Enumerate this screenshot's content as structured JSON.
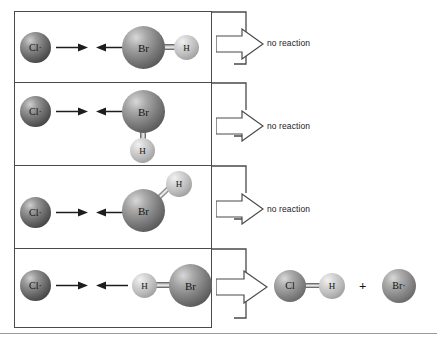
{
  "figure": {
    "type": "reaction-orientation-diagram",
    "width": 437,
    "height": 342,
    "background": "#ffffff",
    "border_color": "#4a4a4a"
  },
  "atoms": {
    "chlorine": {
      "symbol": "Cl",
      "radical_symbol": "Cl·",
      "color": "#6e6e6e"
    },
    "bromine": {
      "symbol": "Br",
      "radical_symbol": "Br·",
      "color": "#7e7e7e"
    },
    "hydrogen": {
      "symbol": "H",
      "color": "#bcbcbc"
    }
  },
  "panels": [
    {
      "id": "panel-1",
      "orientation": "hydrogen-anti-to-chlorine",
      "reactant_radical": "Cl·",
      "molecule": {
        "left_atom": "Br",
        "right_atom": "H"
      },
      "outcome": "no reaction",
      "outcome_label": "no reaction"
    },
    {
      "id": "panel-2",
      "orientation": "hydrogen-perpendicular-below",
      "reactant_radical": "Cl·",
      "molecule": {
        "center_atom": "Br",
        "bottom_atom": "H"
      },
      "outcome": "no reaction",
      "outcome_label": "no reaction"
    },
    {
      "id": "panel-3",
      "orientation": "hydrogen-diagonal-upper-right",
      "reactant_radical": "Cl·",
      "molecule": {
        "center_atom": "Br",
        "diagonal_atom": "H"
      },
      "outcome": "no reaction",
      "outcome_label": "no reaction"
    },
    {
      "id": "panel-4",
      "orientation": "hydrogen-facing-chlorine",
      "reactant_radical": "Cl·",
      "molecule": {
        "left_atom": "H",
        "right_atom": "Br"
      },
      "outcome": "reaction",
      "outcome_label": ""
    }
  ],
  "products": {
    "molecule": {
      "left_atom": "Cl",
      "right_atom": "H"
    },
    "plus": "+",
    "radical": "Br·"
  },
  "labels": {
    "no_reaction_1": "no reaction",
    "no_reaction_2": "no reaction",
    "no_reaction_3": "no reaction",
    "plus": "+",
    "cl_radical_1": "Cl·",
    "cl_radical_2": "Cl·",
    "cl_radical_3": "Cl·",
    "cl_radical_4": "Cl·",
    "br_1": "Br",
    "br_2": "Br",
    "br_3": "Br",
    "br_4": "Br",
    "h_1": "H",
    "h_2": "H",
    "h_3": "H",
    "h_4": "H",
    "product_cl": "Cl",
    "product_h": "H",
    "product_br_radical": "Br·"
  }
}
